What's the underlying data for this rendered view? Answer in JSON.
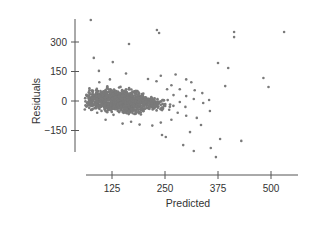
{
  "chart_data": {
    "type": "scatter",
    "title": "",
    "xlabel": "Predicted",
    "ylabel": "Residuals",
    "xlim": [
      60,
      540
    ],
    "ylim": [
      -245,
      415
    ],
    "x_ticks": [
      125,
      250,
      375,
      500
    ],
    "y_ticks": [
      300,
      150,
      0,
      -150
    ],
    "x_tick_labels": [
      "125",
      "250",
      "375",
      "500"
    ],
    "y_tick_labels": [
      "300",
      "150",
      "0",
      "−150"
    ],
    "grid": false,
    "legend": null,
    "point_color": "#7a7a7a",
    "cluster": {
      "description": "dense cloud of several hundred points",
      "x_range": [
        60,
        290
      ],
      "y_range": [
        -110,
        110
      ],
      "center": [
        140,
        0
      ]
    },
    "points": [
      [
        75,
        412
      ],
      [
        165,
        290
      ],
      [
        231,
        361
      ],
      [
        236,
        346
      ],
      [
        413,
        351
      ],
      [
        413,
        325
      ],
      [
        531,
        351
      ],
      [
        82,
        219
      ],
      [
        127,
        198
      ],
      [
        94,
        153
      ],
      [
        375,
        193
      ],
      [
        399,
        168
      ],
      [
        482,
        117
      ],
      [
        494,
        71
      ],
      [
        392,
        76
      ],
      [
        354,
        5
      ],
      [
        430,
        -203
      ],
      [
        356,
        -51
      ],
      [
        325,
        -86
      ],
      [
        335,
        -122
      ],
      [
        309,
        -158
      ],
      [
        243,
        -173
      ],
      [
        252,
        -183
      ],
      [
        380,
        -193
      ],
      [
        318,
        -254
      ],
      [
        370,
        -285
      ],
      [
        358,
        -239
      ],
      [
        293,
        -224
      ],
      [
        158,
        140
      ],
      [
        240,
        128
      ],
      [
        275,
        135
      ],
      [
        300,
        110
      ],
      [
        312,
        95
      ],
      [
        265,
        80
      ],
      [
        285,
        60
      ],
      [
        320,
        55
      ],
      [
        338,
        40
      ],
      [
        300,
        25
      ],
      [
        318,
        10
      ],
      [
        340,
        -10
      ],
      [
        298,
        -30
      ],
      [
        280,
        -60
      ],
      [
        300,
        -75
      ],
      [
        265,
        -95
      ],
      [
        240,
        -110
      ],
      [
        220,
        -125
      ],
      [
        190,
        -120
      ],
      [
        170,
        -105
      ],
      [
        150,
        -115
      ],
      [
        110,
        -95
      ],
      [
        90,
        -60
      ],
      [
        70,
        20
      ],
      [
        66,
        -10
      ],
      [
        72,
        55
      ],
      [
        95,
        95
      ],
      [
        120,
        110
      ],
      [
        210,
        112
      ],
      [
        230,
        100
      ],
      [
        255,
        60
      ],
      [
        270,
        30
      ],
      [
        285,
        -5
      ],
      [
        260,
        -45
      ]
    ]
  },
  "axes": {
    "y_axis_title": "Residuals",
    "x_axis_title": "Predicted"
  }
}
